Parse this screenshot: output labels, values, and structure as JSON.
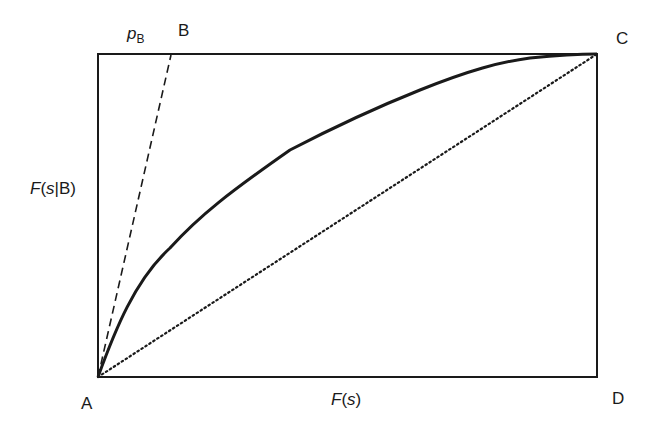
{
  "diagram": {
    "type": "Lorenz/ROC-style curve in rectangle",
    "points": {
      "A": "A",
      "B": "B",
      "C": "C",
      "D": "D"
    },
    "labels": {
      "pb_main": "p",
      "pb_sub": "B",
      "y_axis_f": "F",
      "y_axis_rest_open": "(",
      "y_axis_s": "s",
      "y_axis_rest_close": "|B)",
      "x_axis_f": "F",
      "x_axis_open": "(",
      "x_axis_s": "s",
      "x_axis_close": ")"
    },
    "lines": [
      {
        "name": "solid-curve",
        "style": "solid",
        "from": "A",
        "to": "C"
      },
      {
        "name": "dashed-line",
        "style": "dashed",
        "from": "A",
        "to": "B"
      },
      {
        "name": "dotted-diagonal",
        "style": "dotted",
        "from": "A",
        "to": "C"
      }
    ],
    "colors": {
      "stroke": "#1a1a1a",
      "background": "#ffffff"
    }
  }
}
